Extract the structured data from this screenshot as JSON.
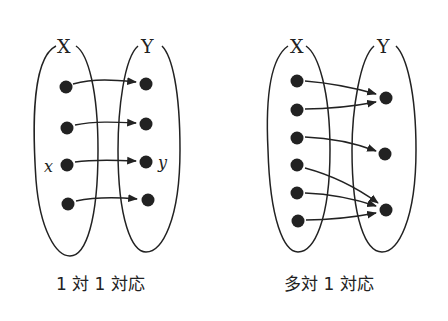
{
  "diagrams": [
    {
      "id": "one-to-one",
      "caption": "1 対 1 対応",
      "set_x_label": "X",
      "set_y_label": "Y",
      "element_x_label": "x",
      "element_y_label": "y",
      "x_points": 4,
      "y_points": 4,
      "mapping": [
        [
          0,
          0
        ],
        [
          1,
          1
        ],
        [
          2,
          2
        ],
        [
          3,
          3
        ]
      ]
    },
    {
      "id": "many-to-one",
      "caption": "多対 1 対応",
      "set_x_label": "X",
      "set_y_label": "Y",
      "x_points": 6,
      "y_points": 3,
      "mapping": [
        [
          0,
          0
        ],
        [
          1,
          0
        ],
        [
          2,
          1
        ],
        [
          3,
          2
        ],
        [
          4,
          2
        ],
        [
          5,
          2
        ]
      ]
    }
  ],
  "colors": {
    "ink": "#222222",
    "background": "#ffffff"
  }
}
